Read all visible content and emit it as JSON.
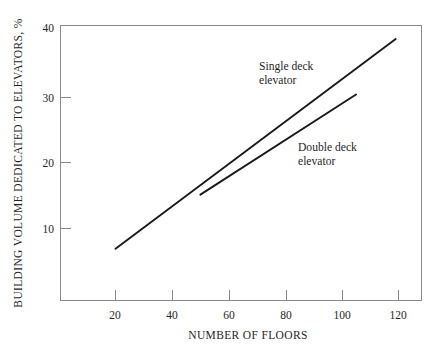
{
  "chart_data": {
    "type": "line",
    "title": "",
    "xlabel": "NUMBER OF FLOORS",
    "ylabel": "BUILDING VOLUME DEDICATED TO ELEVATORS, %",
    "xlim": [
      0,
      130
    ],
    "ylim": [
      0,
      40
    ],
    "xticks": [
      20,
      40,
      60,
      80,
      100,
      120
    ],
    "yticks": [
      10,
      20,
      30,
      40
    ],
    "xtick_labels": [
      "20",
      "40",
      "60",
      "80",
      "100",
      "120"
    ],
    "ytick_labels": [
      "10",
      "20",
      "30",
      "40"
    ],
    "grid": false,
    "legend_position": "inline-annotations",
    "line_color": "#1a1a1a",
    "axis_color": "#8a8a8a",
    "background_color": "#ffffff",
    "series": [
      {
        "name": "Single deck elevator",
        "label_line1": "Single deck",
        "label_line2": "elevator",
        "x": [
          20,
          119
        ],
        "values": [
          7,
          38
        ]
      },
      {
        "name": "Double deck elevator",
        "label_line1": "Double deck",
        "label_line2": "elevator",
        "x": [
          50,
          105
        ],
        "values": [
          15,
          29.8
        ]
      }
    ]
  },
  "annotations": {
    "single_deck": "Single deck\nelevator",
    "double_deck": "Double deck\nelevator"
  }
}
